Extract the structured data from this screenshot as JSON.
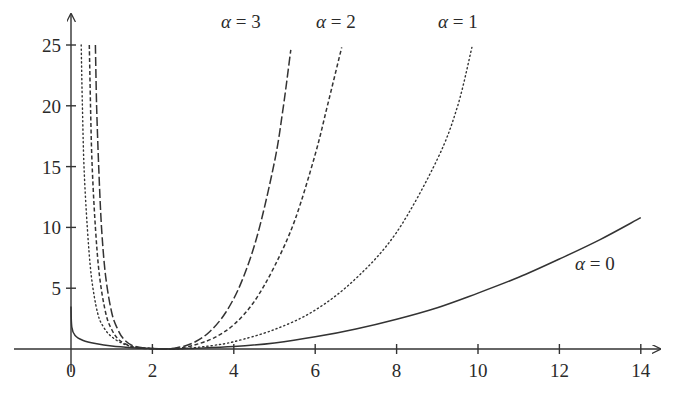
{
  "chart_data": {
    "type": "line",
    "title": "",
    "xlabel": "",
    "ylabel": "",
    "xlim": [
      -1.2,
      14.5
    ],
    "ylim": [
      0,
      26
    ],
    "grid": false,
    "legend": "inline labels",
    "x_ticks": [
      0,
      2,
      4,
      6,
      8,
      10,
      12,
      14
    ],
    "y_ticks": [
      5,
      10,
      15,
      20,
      25
    ],
    "series": [
      {
        "name": "α = 0",
        "style": "solid",
        "x": [
          0.0,
          0.02,
          0.1,
          0.3,
          0.6,
          1.0,
          1.5,
          2.0,
          2.5,
          3.0,
          4.0,
          5.0,
          6.0,
          7.0,
          8.0,
          9.0,
          10.0,
          11.0,
          12.0,
          13.0,
          14.0
        ],
        "y": [
          3.5,
          1.8,
          1.1,
          0.7,
          0.45,
          0.25,
          0.1,
          0.03,
          0.0,
          0.05,
          0.2,
          0.5,
          1.0,
          1.65,
          2.45,
          3.4,
          4.6,
          5.9,
          7.4,
          9.0,
          10.8
        ]
      },
      {
        "name": "α = 1",
        "style": "dotted",
        "x": [
          0.25,
          0.28,
          0.32,
          0.4,
          0.5,
          0.65,
          0.8,
          1.0,
          1.3,
          1.6,
          2.0,
          2.5,
          3.0,
          3.5,
          4.0,
          5.0,
          6.0,
          7.0,
          8.0,
          9.0,
          9.5,
          9.85
        ],
        "y": [
          25,
          20,
          15,
          10,
          6,
          3,
          1.8,
          1.0,
          0.4,
          0.15,
          0.05,
          0.0,
          0.1,
          0.3,
          0.6,
          1.6,
          3.2,
          5.8,
          9.6,
          15.6,
          20,
          24.8
        ]
      },
      {
        "name": "α = 2",
        "style": "dashed",
        "x": [
          0.45,
          0.48,
          0.52,
          0.6,
          0.7,
          0.85,
          1.0,
          1.2,
          1.5,
          1.8,
          2.2,
          2.6,
          3.0,
          3.5,
          4.0,
          4.5,
          5.0,
          5.5,
          6.0,
          6.3,
          6.65
        ],
        "y": [
          25,
          20,
          15,
          10,
          6,
          3,
          1.6,
          0.7,
          0.2,
          0.05,
          0.0,
          0.05,
          0.3,
          0.9,
          2.0,
          3.9,
          6.8,
          10.6,
          16,
          20,
          24.8
        ]
      },
      {
        "name": "α = 3",
        "style": "long-dashed",
        "x": [
          0.6,
          0.63,
          0.68,
          0.75,
          0.85,
          1.0,
          1.15,
          1.3,
          1.5,
          1.8,
          2.2,
          2.6,
          3.0,
          3.4,
          3.8,
          4.2,
          4.6,
          5.0,
          5.2,
          5.4
        ],
        "y": [
          25,
          20,
          15,
          10,
          6,
          3,
          1.6,
          0.8,
          0.3,
          0.08,
          0.0,
          0.1,
          0.5,
          1.4,
          3.0,
          5.6,
          9.6,
          15.4,
          19.5,
          24.6
        ]
      }
    ],
    "annotations": [
      {
        "text": "α = 3",
        "x": 4.9,
        "y": 27.3
      },
      {
        "text": "α = 2",
        "x": 6.9,
        "y": 27.3
      },
      {
        "text": "α = 1",
        "x": 9.9,
        "y": 27.3
      },
      {
        "text": "α = 0",
        "x": 13.2,
        "y": 7.0
      }
    ]
  },
  "labels": {
    "x_ticks": [
      "0",
      "2",
      "4",
      "6",
      "8",
      "10",
      "12",
      "14"
    ],
    "y_ticks": [
      "5",
      "10",
      "15",
      "20",
      "25"
    ],
    "series": {
      "a3": {
        "sym": "α",
        "rest": " = 3"
      },
      "a2": {
        "sym": "α",
        "rest": " = 2"
      },
      "a1": {
        "sym": "α",
        "rest": " = 1"
      },
      "a0": {
        "sym": "α",
        "rest": " = 0"
      }
    }
  }
}
